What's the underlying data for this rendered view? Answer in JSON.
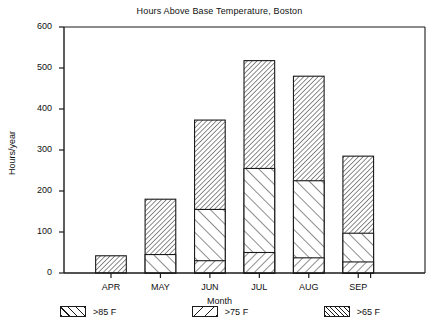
{
  "chart_data": {
    "type": "bar",
    "subtype": "stacked",
    "title": "Hours Above Base Temperature, Boston",
    "xlabel": "Month",
    "ylabel": "Hours/year",
    "categories": [
      "APR",
      "MAY",
      "JUN",
      "JUL",
      "AUG",
      "SEP"
    ],
    "series": [
      {
        "name": ">85 F",
        "hatch": "h85",
        "values": [
          0,
          0,
          30,
          50,
          37,
          27
        ]
      },
      {
        "name": ">75 F",
        "hatch": "h75",
        "values": [
          0,
          45,
          155,
          255,
          225,
          97
        ]
      },
      {
        "name": ">65 F",
        "hatch": "h65",
        "values": [
          42,
          180,
          373,
          518,
          480,
          285
        ]
      }
    ],
    "ylim": [
      0,
      600
    ],
    "yticks": [
      0,
      100,
      200,
      300,
      400,
      500,
      600
    ],
    "ytick_labels": [
      "0",
      "100",
      "200",
      "300",
      "400",
      "500",
      "600"
    ],
    "grid": false,
    "legend_position": "bottom",
    "legend_entries": [
      ">85 F",
      ">75 F",
      ">65 F"
    ]
  }
}
